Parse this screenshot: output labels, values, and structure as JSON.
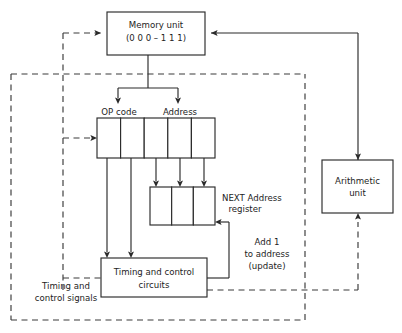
{
  "diagram": {
    "type": "block-diagram",
    "colors": {
      "line": "#2b2b2b",
      "dashed_line": "#3a3a3a",
      "text": "#1d1d1d",
      "background": "#ffffff"
    },
    "blocks": {
      "memory_unit": {
        "line1": "Memory unit",
        "line2": "(0 0 0 – 1 1 1)"
      },
      "arithmetic_unit": {
        "line1": "Arithmetic",
        "line2": "unit"
      },
      "timing_control_circuits": {
        "line1": "Timing and control",
        "line2": "circuits"
      },
      "instruction_register": {
        "cells": 5,
        "op_code_label": "OP code",
        "address_label": "Address"
      },
      "next_address_register": {
        "cells": 3,
        "line1": "NEXT  Address",
        "line2": "register"
      }
    },
    "labels": {
      "add_one": {
        "line1": "Add 1",
        "line2": "to address",
        "line3": "(update)"
      },
      "timing_signals": {
        "line1": "Timing and",
        "line2": "control signals"
      }
    }
  }
}
